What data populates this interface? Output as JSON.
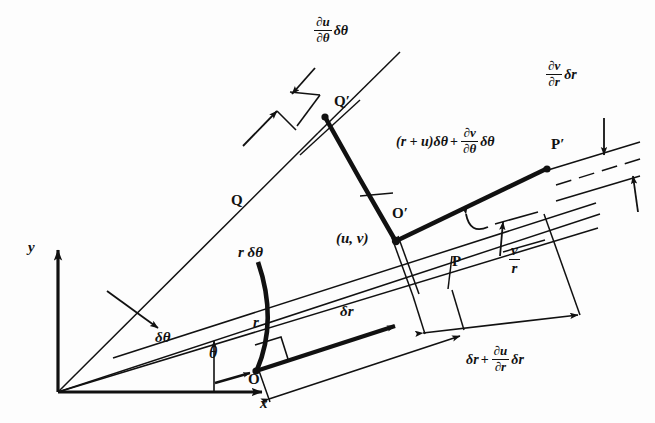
{
  "figure": {
    "background_color": "#fdfdfd",
    "ink_color": "#111111"
  },
  "axes": {
    "y_label": "y",
    "x_label": "x",
    "angle_label": "θ"
  },
  "points": {
    "origin_O": "O",
    "point_P": "P",
    "point_Q": "Q",
    "point_O_prime": "O′",
    "point_P_prime": "P′",
    "point_Q_prime": "Q′"
  },
  "labels": {
    "displacement": "(u, v)",
    "radius": "r",
    "arc_length": "r δθ",
    "delta_theta": "δθ",
    "delta_r": "δr"
  },
  "expressions": {
    "du_dtheta_dtheta": {
      "num": "∂u",
      "den": "∂θ",
      "tail": "δθ"
    },
    "dv_dr_dr": {
      "num": "∂v",
      "den": "∂r",
      "tail": "δr"
    },
    "hoop_stretch": {
      "lead": "(r + u)δθ",
      "op": "+",
      "num": "∂v",
      "den": "∂θ",
      "tail": "δθ"
    },
    "radial_stretch": {
      "lead": "δr",
      "op": "+",
      "num": "∂u",
      "den": "∂r",
      "tail": "δr"
    },
    "v_over_r": {
      "num": "v",
      "den": "r"
    }
  }
}
